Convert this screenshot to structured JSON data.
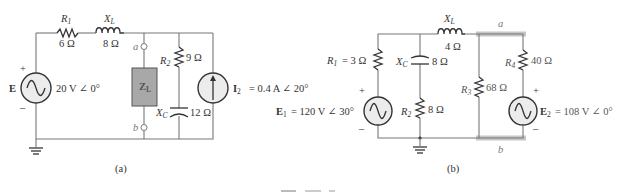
{
  "figure": {
    "caption_clipped": true,
    "panels": [
      {
        "id": "a",
        "label": "(a)",
        "components": {
          "R1": {
            "name": "R",
            "sub": "1",
            "value": "6 Ω"
          },
          "XL": {
            "name": "X",
            "sub": "L",
            "value": "8 Ω"
          },
          "E": {
            "name": "E",
            "value": "20 V ∠ 0°",
            "plus": "+",
            "minus": "–"
          },
          "ZL": {
            "name": "Z",
            "sub": "L"
          },
          "R2": {
            "name": "R",
            "sub": "2",
            "value": "9 Ω"
          },
          "XC": {
            "name": "X",
            "sub": "C",
            "value": "12 Ω"
          },
          "I2": {
            "name": "I",
            "sub": "2",
            "value": "= 0.4 A ∠ 20°"
          },
          "terminal_a": "a",
          "terminal_b": "b"
        }
      },
      {
        "id": "b",
        "label": "(b)",
        "components": {
          "R1": {
            "name": "R",
            "sub": "1",
            "value": "= 3 Ω"
          },
          "XL": {
            "name": "X",
            "sub": "L",
            "value": "4 Ω"
          },
          "XC": {
            "name": "X",
            "sub": "C",
            "value": "8 Ω"
          },
          "R2": {
            "name": "R",
            "sub": "2",
            "value": "8 Ω"
          },
          "E1": {
            "name": "E",
            "sub": "1",
            "value": "= 120 V ∠ 30°",
            "plus": "+",
            "minus": "–"
          },
          "R3": {
            "name": "R",
            "sub": "3",
            "value": "68 Ω"
          },
          "R4": {
            "name": "R",
            "sub": "4",
            "value": "40 Ω"
          },
          "E2": {
            "name": "E",
            "sub": "2",
            "value": "= 108 V ∠ 0°",
            "plus": "+",
            "minus": "–"
          },
          "terminal_a": "a",
          "terminal_b": "b"
        }
      }
    ]
  }
}
